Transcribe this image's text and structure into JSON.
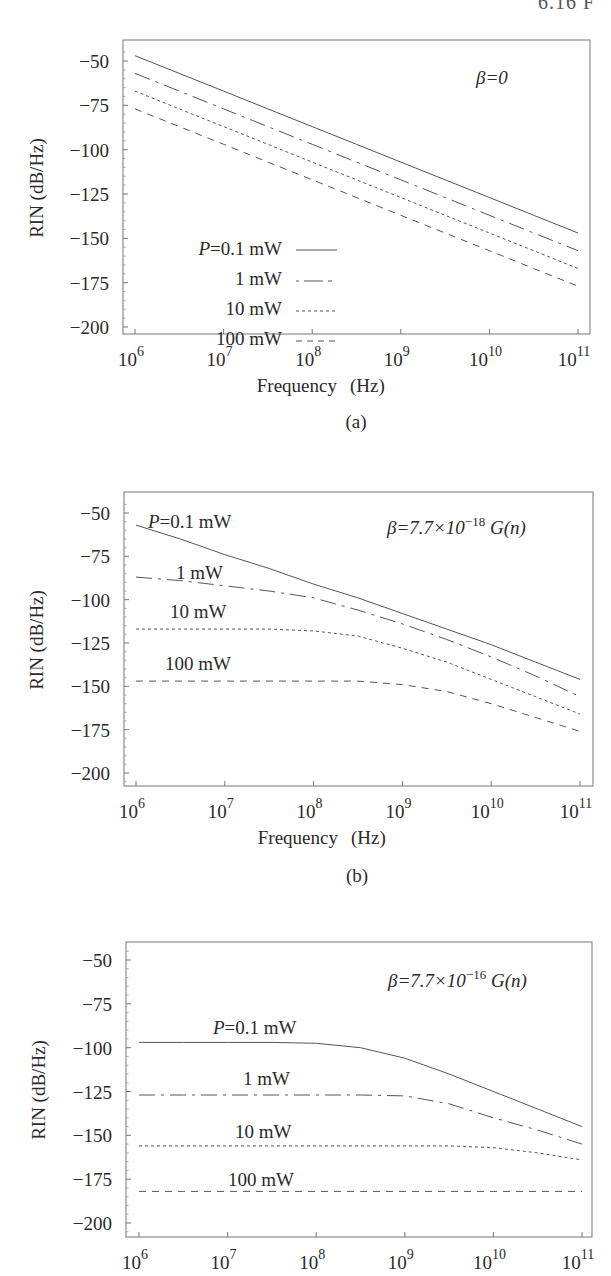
{
  "page_header": "6.16  F",
  "colors": {
    "frame": "#777777",
    "curve": "#555555",
    "text": "#2a2a2a"
  },
  "line_styles": {
    "0.1 mW": "solid",
    "1 mW": "dash-dot",
    "10 mW": "dotted",
    "100 mW": "dashed"
  },
  "chart_data": [
    {
      "type": "line",
      "panel_label": "(a)",
      "title": "",
      "annotation": "β=0",
      "xlabel": "Frequency   (Hz)",
      "ylabel": "RIN (dB/Hz)",
      "xscale": "log",
      "xlim": [
        1000000.0,
        100000000000.0
      ],
      "ylim": [
        -210,
        -40
      ],
      "x_ticks": [
        "10^6",
        "10^7",
        "10^8",
        "10^9",
        "10^10",
        "10^11"
      ],
      "y_ticks": [
        -50,
        -75,
        -100,
        -125,
        -150,
        -175,
        -200
      ],
      "grid": false,
      "legend": {
        "position": "lower-left inside",
        "entries": [
          "P=0.1 mW",
          "1 mW",
          "10 mW",
          "100 mW"
        ]
      },
      "x_log10": [
        6,
        6.5,
        7,
        7.5,
        8,
        8.5,
        9,
        9.5,
        10,
        10.5,
        11
      ],
      "series": [
        {
          "name": "P=0.1 mW",
          "style": "solid",
          "values": [
            -47,
            -57,
            -67,
            -77,
            -87,
            -97,
            -107,
            -117,
            -127,
            -137,
            -147
          ]
        },
        {
          "name": "1 mW",
          "style": "dash-dot",
          "values": [
            -57,
            -67,
            -77,
            -87,
            -97,
            -107,
            -117,
            -127,
            -137,
            -147,
            -157
          ]
        },
        {
          "name": "10 mW",
          "style": "dotted",
          "values": [
            -67,
            -77,
            -87,
            -97,
            -107,
            -117,
            -127,
            -137,
            -147,
            -157,
            -167
          ]
        },
        {
          "name": "100 mW",
          "style": "dashed",
          "values": [
            -77,
            -87,
            -97,
            -107,
            -117,
            -127,
            -137,
            -147,
            -157,
            -167,
            -177
          ]
        }
      ]
    },
    {
      "type": "line",
      "panel_label": "(b)",
      "title": "",
      "annotation": "β=7.7×10⁻¹⁸ G(n)",
      "xlabel": "Frequency   (Hz)",
      "ylabel": "RIN (dB/Hz)",
      "xscale": "log",
      "xlim": [
        1000000.0,
        100000000000.0
      ],
      "ylim": [
        -210,
        -40
      ],
      "x_ticks": [
        "10^6",
        "10^7",
        "10^8",
        "10^9",
        "10^10",
        "10^11"
      ],
      "y_ticks": [
        -50,
        -75,
        -100,
        -125,
        -150,
        -175,
        -200
      ],
      "grid": false,
      "curve_labels": [
        "P=0.1 mW",
        "1 mW",
        "10 mW",
        "100 mW"
      ],
      "x_log10": [
        6,
        6.5,
        7,
        7.5,
        8,
        8.5,
        9,
        9.5,
        10,
        10.5,
        11
      ],
      "series": [
        {
          "name": "P=0.1 mW",
          "style": "solid",
          "values": [
            -57,
            -65,
            -74,
            -82,
            -91,
            -99,
            -108,
            -117,
            -126,
            -136,
            -146
          ]
        },
        {
          "name": "1 mW",
          "style": "dash-dot",
          "values": [
            -87,
            -89,
            -92,
            -95,
            -99,
            -106,
            -114,
            -123,
            -133,
            -144,
            -156
          ]
        },
        {
          "name": "10 mW",
          "style": "dotted",
          "values": [
            -117,
            -117,
            -117,
            -117,
            -118,
            -121,
            -128,
            -136,
            -146,
            -156,
            -166
          ]
        },
        {
          "name": "100 mW",
          "style": "dashed",
          "values": [
            -147,
            -147,
            -147,
            -147,
            -147,
            -147,
            -149,
            -153,
            -160,
            -168,
            -176
          ]
        }
      ]
    },
    {
      "type": "line",
      "panel_label": "",
      "title": "",
      "annotation": "β=7.7×10⁻¹⁶ G(n)",
      "xlabel": "",
      "ylabel": "RIN (dB/Hz)",
      "xscale": "log",
      "xlim": [
        1000000.0,
        100000000000.0
      ],
      "ylim": [
        -210,
        -40
      ],
      "x_ticks": [
        "10^6",
        "10^7",
        "10^8",
        "10^9",
        "10^10",
        "10^11"
      ],
      "y_ticks": [
        -50,
        -75,
        -100,
        -125,
        -150,
        -175,
        -200
      ],
      "grid": false,
      "curve_labels": [
        "P=0.1 mW",
        "1 mW",
        "10 mW",
        "100 mW"
      ],
      "x_log10": [
        6,
        6.5,
        7,
        7.5,
        8,
        8.5,
        9,
        9.5,
        10,
        10.5,
        11
      ],
      "series": [
        {
          "name": "P=0.1 mW",
          "style": "solid",
          "values": [
            -97,
            -97,
            -97,
            -97,
            -97.5,
            -100,
            -106,
            -115,
            -125,
            -135,
            -145
          ]
        },
        {
          "name": "1 mW",
          "style": "dash-dot",
          "values": [
            -127,
            -127,
            -127,
            -127,
            -127,
            -127,
            -127.5,
            -132,
            -140,
            -147,
            -155
          ]
        },
        {
          "name": "10 mW",
          "style": "dotted",
          "values": [
            -156,
            -156,
            -156,
            -156,
            -156,
            -156,
            -156,
            -156,
            -157,
            -160,
            -164
          ]
        },
        {
          "name": "100 mW",
          "style": "dashed",
          "values": [
            -182,
            -182,
            -182,
            -182,
            -182,
            -182,
            -182,
            -182,
            -182,
            -182,
            -182
          ]
        }
      ]
    }
  ],
  "panels": [
    {
      "id": "a",
      "annotation": "β=0",
      "ylabel": "RIN (dB/Hz)",
      "xlabel_freq": "Frequency",
      "xlabel_unit": "(Hz)",
      "panel_label": "(a)",
      "y_tick_labels": [
        "−50",
        "−75",
        "−100",
        "−125",
        "−150",
        "−175",
        "−200"
      ],
      "x_tick_bases": [
        "10",
        "10",
        "10",
        "10",
        "10",
        "10"
      ],
      "x_tick_exps": [
        "6",
        "7",
        "8",
        "9",
        "10",
        "11"
      ],
      "legend": [
        {
          "prefix": "P",
          "label": "=0.1  mW"
        },
        {
          "prefix": "",
          "label": "1  mW"
        },
        {
          "prefix": "",
          "label": "10  mW"
        },
        {
          "prefix": "",
          "label": "100  mW"
        }
      ]
    },
    {
      "id": "b",
      "annotation_beta": "β=7.7×10",
      "annotation_exp": "−18",
      "annotation_tail": " G(n)",
      "ylabel": "RIN (dB/Hz)",
      "xlabel_freq": "Frequency",
      "xlabel_unit": "(Hz)",
      "panel_label": "(b)",
      "y_tick_labels": [
        "−50",
        "−75",
        "−100",
        "−125",
        "−150",
        "−175",
        "−200"
      ],
      "x_tick_bases": [
        "10",
        "10",
        "10",
        "10",
        "10",
        "10"
      ],
      "x_tick_exps": [
        "6",
        "7",
        "8",
        "9",
        "10",
        "11"
      ],
      "curve_labels": [
        {
          "prefix": "P",
          "label": "=0.1  mW"
        },
        {
          "prefix": "",
          "label": "1  mW"
        },
        {
          "prefix": "",
          "label": "10  mW"
        },
        {
          "prefix": "",
          "label": "100  mW"
        }
      ]
    },
    {
      "id": "c",
      "annotation_beta": "β=7.7×10",
      "annotation_exp": "−16",
      "annotation_tail": " G(n)",
      "ylabel": "RIN (dB/Hz)",
      "y_tick_labels": [
        "−50",
        "−75",
        "−100",
        "−125",
        "−150",
        "−175",
        "−200"
      ],
      "x_tick_bases": [
        "10",
        "10",
        "10",
        "10",
        "10",
        "10"
      ],
      "x_tick_exps": [
        "6",
        "7",
        "8",
        "9",
        "10",
        "11"
      ],
      "curve_labels": [
        {
          "prefix": "P",
          "label": "=0.1  mW"
        },
        {
          "prefix": "",
          "label": "1  mW"
        },
        {
          "prefix": "",
          "label": "10  mW"
        },
        {
          "prefix": "",
          "label": "100  mW"
        }
      ]
    }
  ]
}
